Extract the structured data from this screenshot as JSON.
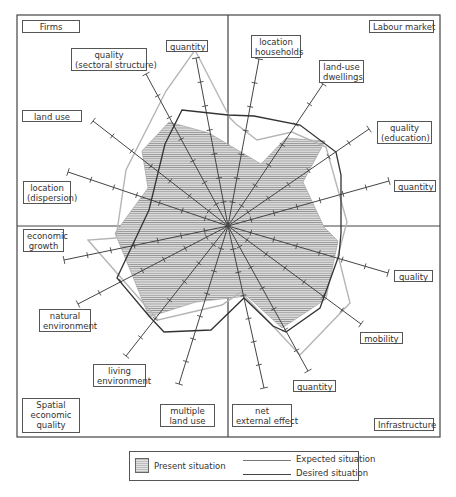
{
  "diagram": {
    "center": [
      228,
      226
    ],
    "frame": {
      "x": 17,
      "y": 15,
      "w": 423,
      "h": 422
    },
    "colors": {
      "present_fill": "#d6d6d6",
      "present_hatch": "#8a8a8a",
      "expected": "#b5b5b5",
      "desired": "#333333",
      "axis": "#444444",
      "frame": "#444444"
    },
    "quadrants": [
      {
        "name": "Firms",
        "label": "Firms",
        "box": [
          22,
          20,
          58,
          13
        ]
      },
      {
        "name": "Labour market",
        "label": "Labour market",
        "box": [
          369,
          20,
          65,
          13
        ]
      },
      {
        "name": "Spatial economic quality",
        "label": "Spatial\neconomic\nquality",
        "box": [
          22,
          398,
          58,
          35
        ]
      },
      {
        "name": "Infrastructure",
        "label": "Infrastructure",
        "box": [
          374,
          418,
          60,
          13
        ]
      }
    ],
    "axes": [
      {
        "label": "quantity",
        "quadrant": "Firms",
        "end": [
          196,
          58
        ],
        "box": [
          166,
          40,
          42,
          12
        ]
      },
      {
        "label": "quality\n(sectoral structure)",
        "quadrant": "Firms",
        "end": [
          146,
          74
        ],
        "box": [
          71,
          48,
          76,
          23
        ]
      },
      {
        "label": "land use",
        "quadrant": "Firms",
        "end": [
          93,
          121
        ],
        "box": [
          22,
          110,
          60,
          12
        ]
      },
      {
        "label": "location\n(dispersion)",
        "quadrant": "Firms",
        "end": [
          68,
          172
        ],
        "box": [
          23,
          181,
          48,
          23
        ]
      },
      {
        "label": "location\nhouseholds",
        "quadrant": "Labour market",
        "end": [
          259,
          59
        ],
        "box": [
          251,
          35,
          50,
          23
        ]
      },
      {
        "label": "land-use\ndwellings",
        "quadrant": "Labour market",
        "end": [
          323,
          84
        ],
        "box": [
          319,
          60,
          45,
          23
        ]
      },
      {
        "label": "quality\n(education)",
        "quadrant": "Labour market",
        "end": [
          369,
          129
        ],
        "box": [
          377,
          121,
          55,
          23
        ]
      },
      {
        "label": "quantity",
        "quadrant": "Labour market",
        "end": [
          389,
          181
        ],
        "box": [
          394,
          180,
          42,
          12
        ]
      },
      {
        "label": "quality",
        "quadrant": "Infrastructure",
        "end": [
          388,
          273
        ],
        "box": [
          394,
          270,
          39,
          12
        ]
      },
      {
        "label": "mobility",
        "quadrant": "Infrastructure",
        "end": [
          361,
          324
        ],
        "box": [
          360,
          332,
          43,
          12
        ]
      },
      {
        "label": "quantity",
        "quadrant": "Infrastructure",
        "end": [
          308,
          371
        ],
        "box": [
          293,
          380,
          43,
          12
        ]
      },
      {
        "label": "net\nexternal effect",
        "quadrant": "Infrastructure",
        "end": [
          264,
          388
        ],
        "box": [
          232,
          404,
          60,
          23
        ]
      },
      {
        "label": "multiple\nland use",
        "quadrant": "Spatial economic quality",
        "end": [
          179,
          384
        ],
        "box": [
          160,
          404,
          55,
          23
        ]
      },
      {
        "label": "living\nenvironment",
        "quadrant": "Spatial economic quality",
        "end": [
          126,
          356
        ],
        "box": [
          93,
          364,
          53,
          23
        ]
      },
      {
        "label": "natural\nenvironment",
        "quadrant": "Spatial economic quality",
        "end": [
          78,
          304
        ],
        "box": [
          39,
          309,
          52,
          23
        ]
      },
      {
        "label": "economic\ngrowth",
        "quadrant": "Spatial economic quality",
        "end": [
          64,
          260
        ],
        "box": [
          23,
          229,
          41,
          23
        ]
      }
    ],
    "ticks_per_axis": 7,
    "series": {
      "present": {
        "label": "Present situation",
        "points": [
          [
            209,
            133
          ],
          [
            169,
            122
          ],
          [
            142,
            151
          ],
          [
            148,
            188
          ],
          [
            115,
            233
          ],
          [
            133,
            277
          ],
          [
            149,
            317
          ],
          [
            196,
            302
          ],
          [
            247,
            296
          ],
          [
            282,
            328
          ],
          [
            326,
            299
          ],
          [
            338,
            241
          ],
          [
            324,
            227
          ],
          [
            303,
            182
          ],
          [
            325,
            141
          ],
          [
            286,
            138
          ],
          [
            261,
            164
          ]
        ]
      },
      "expected": {
        "label": "Expected situation",
        "points": [
          [
            230,
            118
          ],
          [
            195,
            50
          ],
          [
            166,
            91
          ],
          [
            126,
            170
          ],
          [
            116,
            238
          ],
          [
            88,
            240
          ],
          [
            158,
            320
          ],
          [
            222,
            305
          ],
          [
            241,
            292
          ],
          [
            300,
            355
          ],
          [
            350,
            303
          ],
          [
            338,
            255
          ],
          [
            347,
            222
          ],
          [
            326,
            147
          ],
          [
            292,
            132
          ],
          [
            257,
            140
          ],
          [
            236,
            124
          ]
        ]
      },
      "desired": {
        "label": "Desired situation",
        "points": [
          [
            228,
            115
          ],
          [
            254,
            116
          ],
          [
            300,
            125
          ],
          [
            336,
            152
          ],
          [
            341,
            175
          ],
          [
            341,
            233
          ],
          [
            339,
            255
          ],
          [
            320,
            308
          ],
          [
            286,
            332
          ],
          [
            273,
            326
          ],
          [
            244,
            298
          ],
          [
            211,
            330
          ],
          [
            164,
            332
          ],
          [
            149,
            316
          ],
          [
            117,
            278
          ],
          [
            133,
            244
          ],
          [
            149,
            210
          ],
          [
            165,
            144
          ],
          [
            182,
            110
          ]
        ]
      }
    }
  },
  "legend": {
    "present": "Present situation",
    "expected": "Expected situation",
    "desired": "Desired situation"
  },
  "chart_data": {
    "type": "radar",
    "title": "",
    "quadrants": [
      "Firms",
      "Labour market",
      "Infrastructure",
      "Spatial economic quality"
    ],
    "categories": [
      "Firms: quantity",
      "Firms: quality (sectoral structure)",
      "Firms: land use",
      "Firms: location (dispersion)",
      "Labour market: location households",
      "Labour market: land-use dwellings",
      "Labour market: quality (education)",
      "Labour market: quantity",
      "Infrastructure: quality",
      "Infrastructure: mobility",
      "Infrastructure: quantity",
      "Infrastructure: net external effect",
      "Spatial economic quality: multiple land use",
      "Spatial economic quality: living environment",
      "Spatial economic quality: natural environment",
      "Spatial economic quality: economic growth"
    ],
    "series": [
      {
        "name": "Present situation",
        "style": "hatched fill"
      },
      {
        "name": "Expected situation",
        "style": "light grey line"
      },
      {
        "name": "Desired situation",
        "style": "dark line"
      }
    ],
    "legend_position": "bottom"
  }
}
